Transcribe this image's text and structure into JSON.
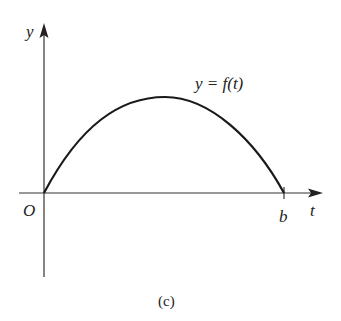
{
  "figure": {
    "caption": "(c)",
    "curve_label": "y = f(t)",
    "axes": {
      "y_label": "y",
      "x_label": "t",
      "origin_label": "O",
      "x_end_label": "b"
    },
    "colors": {
      "stroke": "#1a1a1a",
      "axis": "#333333",
      "background": "#ffffff"
    }
  }
}
